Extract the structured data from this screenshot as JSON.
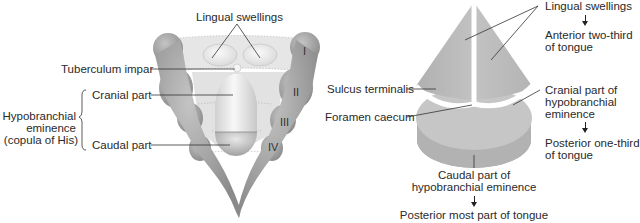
{
  "left_figure": {
    "labels": {
      "lingual_swellings": "Lingual swellings",
      "tuberculum_impar": "Tuberculum impar",
      "cranial_part": "Cranial part",
      "caudal_part": "Caudal part",
      "hypobranchial_line1": "Hypobranchial",
      "hypobranchial_line2": "eminence",
      "hypobranchial_line3": "(copula of His)"
    },
    "arches": [
      "I",
      "II",
      "III",
      "IV"
    ]
  },
  "right_figure": {
    "labels": {
      "lingual_swellings": "Lingual swellings",
      "anterior_line1": "Anterior two-third",
      "anterior_line2": "of tongue",
      "sulcus_terminalis": "Sulcus terminalis",
      "foramen_caecum": "Foramen caecum",
      "cranial_line1": "Cranial part of",
      "cranial_line2": "hypobranchial",
      "cranial_line3": "eminence",
      "posterior_one_third_line1": "Posterior one-third",
      "posterior_one_third_line2": "of tongue",
      "caudal_line1": "Caudal part of",
      "caudal_line2": "hypobranchial eminence",
      "posterior_most": "Posterior most part of tongue"
    }
  },
  "colors": {
    "arch_gray": "#9a9a9a",
    "band_gray": "#e4e4e4",
    "swelling_light": "#eeeeee",
    "tongue_gray": "#b8b8b8",
    "tongue_base": "#c8c8c8",
    "line": "#333333"
  }
}
